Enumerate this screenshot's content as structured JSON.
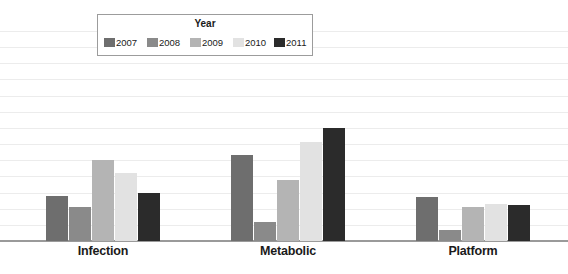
{
  "chart_data": {
    "type": "bar",
    "title": "",
    "subtitle": "",
    "xlabel": "",
    "ylabel": "",
    "categories": [
      "Infection",
      "Metabolic",
      "Platform"
    ],
    "series": [
      {
        "name": "2007",
        "color": "#6e6e6e",
        "values": [
          2.8,
          5.3,
          2.7
        ]
      },
      {
        "name": "2008",
        "color": "#8a8a8a",
        "values": [
          2.1,
          1.2,
          0.7
        ]
      },
      {
        "name": "2009",
        "color": "#b4b4b4",
        "values": [
          5.0,
          3.8,
          2.1
        ]
      },
      {
        "name": "2010",
        "color": "#e2e2e2",
        "values": [
          4.2,
          6.1,
          2.3
        ]
      },
      {
        "name": "2011",
        "color": "#2b2b2b",
        "values": [
          3.0,
          7.0,
          2.2
        ]
      }
    ],
    "ylim": [
      0,
      13
    ],
    "gridlines": 13,
    "grid": true,
    "grid_color": "#ececec",
    "axis_color": "#9a9a9a",
    "legend": {
      "title": "Year",
      "position": "top-center",
      "entries": [
        "2007",
        "2008",
        "2009",
        "2010",
        "2011"
      ]
    },
    "tick_labels_y": [],
    "background": "#ffffff"
  },
  "layout": {
    "plot_top": 31,
    "plot_bottom": 241,
    "group_centers": [
      103,
      288,
      473
    ],
    "bar_width": 22,
    "bar_gap": 1,
    "legend_item_offsets": [
      0,
      43,
      86,
      129,
      170
    ]
  }
}
